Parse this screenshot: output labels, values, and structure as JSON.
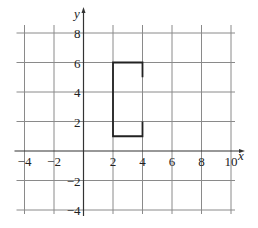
{
  "chart_data": {
    "type": "line",
    "title": "",
    "xlabel": "x",
    "ylabel": "y",
    "xlim": [
      -4,
      10
    ],
    "ylim": [
      -4,
      8
    ],
    "grid": true,
    "grid_step": 2,
    "x_tick_labels": [
      "-4",
      "-2",
      "2",
      "4",
      "6",
      "8",
      "10"
    ],
    "y_tick_labels": [
      "8",
      "6",
      "4",
      "2",
      "-2",
      "-4"
    ],
    "series": [
      {
        "name": "open-rectangle",
        "points": [
          [
            4,
            5
          ],
          [
            4,
            6
          ],
          [
            2,
            6
          ],
          [
            2,
            1
          ],
          [
            4,
            1
          ],
          [
            4,
            2
          ]
        ]
      }
    ],
    "colors": {
      "grid": "#8a8a8a",
      "axis": "#333333",
      "shape": "#222222"
    }
  }
}
